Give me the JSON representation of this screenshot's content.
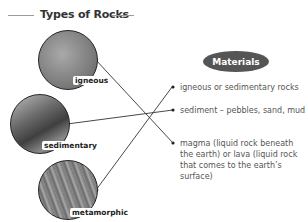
{
  "title": "Types of Rocks",
  "rocks": [
    {
      "id": "igneous",
      "label": "igneous",
      "color": "#8a8a8a"
    },
    {
      "id": "sedimentary",
      "label": "sedimentary",
      "color": "#6e6e6e"
    },
    {
      "id": "metamorphic",
      "label": "metamorphic",
      "color": "#7a7a7a"
    }
  ],
  "materials": {
    "heading": "Materials",
    "items": [
      {
        "text": "igneous or sedimentary rocks",
        "connects_to": "metamorphic"
      },
      {
        "text": "sediment – pebbles, sand, mud",
        "connects_to": "sedimentary"
      },
      {
        "text": "magma (liquid rock beneath the earth) or lava (liquid rock that comes to the earth’s surface)",
        "connects_to": "igneous"
      }
    ]
  },
  "colors": {
    "pill": "#555555",
    "text": "#555555",
    "line": "#333333"
  }
}
